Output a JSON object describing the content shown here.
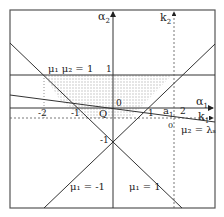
{
  "diagram": {
    "axes": {
      "horizontal_label": "α",
      "horizontal_sub": "1",
      "vertical_label": "α",
      "vertical_sub": "2",
      "k1_label": "k",
      "k1_sub": "1",
      "k2_label": "k",
      "k2_sub": "2"
    },
    "ticks": {
      "minus_two": "-2",
      "minus_one": "-1",
      "origin": "0",
      "one": "1",
      "two": "2",
      "top_one": "1",
      "bottom_minus_one": "-1",
      "a1_zero": "0"
    },
    "points": {
      "q_label": "Q",
      "a1_label": "a",
      "a1_sub": "1"
    },
    "curves": {
      "product_line_mu": "μ",
      "product_line_text": "μ₁ μ₂ = 1",
      "mu1_minus_label": "μ₁ = -1",
      "mu1_plus_label": "μ₁ = 1",
      "mu2_lambda_label": "μ₂ = λₛ"
    },
    "colors": {
      "line": "#333333",
      "shade": "#d8d8d8",
      "frame": "#555555"
    }
  }
}
